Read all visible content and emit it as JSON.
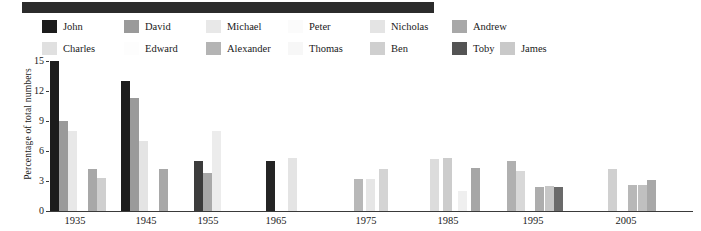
{
  "banner": {
    "label": ""
  },
  "legend": {
    "items": [
      {
        "label": "John",
        "color": "#1c1c1c",
        "x": 42,
        "y": 2
      },
      {
        "label": "David",
        "color": "#9a9a9a",
        "x": 124,
        "y": 2
      },
      {
        "label": "Michael",
        "color": "#e8e8e8",
        "x": 206,
        "y": 2
      },
      {
        "label": "Peter",
        "color": "#fbfbfb",
        "x": 288,
        "y": 2
      },
      {
        "label": "Nicholas",
        "color": "#e4e4e4",
        "x": 370,
        "y": 2
      },
      {
        "label": "Andrew",
        "color": "#a8a8a8",
        "x": 452,
        "y": 2
      },
      {
        "label": "James",
        "color": "#c9c9c9",
        "x": 500,
        "y": 24
      },
      {
        "label": "Charles",
        "color": "#e0e0e0",
        "x": 42,
        "y": 24
      },
      {
        "label": "Edward",
        "color": "#fdfdfd",
        "x": 124,
        "y": 24
      },
      {
        "label": "Alexander",
        "color": "#b4b4b4",
        "x": 206,
        "y": 24
      },
      {
        "label": "Thomas",
        "color": "#f7f7f7",
        "x": 288,
        "y": 24
      },
      {
        "label": "Ben",
        "color": "#cfcfcf",
        "x": 370,
        "y": 24
      },
      {
        "label": "Toby",
        "color": "#545454",
        "x": 452,
        "y": 24
      }
    ]
  },
  "chart_data": {
    "type": "bar",
    "title": "",
    "xlabel": "",
    "ylabel": "Percentage of total numbers",
    "ylim": [
      0,
      15
    ],
    "yticks": [
      0,
      3,
      6,
      9,
      12,
      15
    ],
    "grid": false,
    "legend_position": "top",
    "categories": [
      "1935",
      "1945",
      "1955",
      "1965",
      "1975",
      "1985",
      "1995",
      "2005"
    ],
    "series": [
      {
        "name": "John",
        "color": "#1c1c1c",
        "values": [
          15.0,
          13.0,
          5.0,
          5.0,
          0,
          0,
          0,
          0
        ]
      },
      {
        "name": "David",
        "color": "#9a9a9a",
        "values": [
          9.0,
          11.3,
          3.8,
          0,
          0,
          0,
          0,
          0
        ]
      },
      {
        "name": "Michael",
        "color": "#e8e8e8",
        "values": [
          8.0,
          7.0,
          8.0,
          0,
          0,
          0,
          0,
          0
        ]
      },
      {
        "name": "Peter",
        "color": "#fbfbfb",
        "values": [
          0,
          0,
          0,
          0,
          0,
          0,
          0,
          0
        ]
      },
      {
        "name": "Nicholas",
        "color": "#e4e4e4",
        "values": [
          0,
          0,
          0,
          5.3,
          0,
          0,
          0,
          0
        ]
      },
      {
        "name": "Andrew",
        "color": "#a8a8a8",
        "values": [
          4.2,
          4.2,
          0,
          0,
          3.2,
          0,
          0,
          0
        ]
      },
      {
        "name": "Charles",
        "color": "#e0e0e0",
        "values": [
          3.3,
          0,
          0,
          0,
          3.2,
          5.2,
          0,
          0
        ]
      },
      {
        "name": "Edward",
        "color": "#fdfdfd",
        "values": [
          0,
          0,
          0,
          0,
          4.2,
          5.3,
          0,
          0
        ]
      },
      {
        "name": "Alexander",
        "color": "#b4b4b4",
        "values": [
          0,
          0,
          0,
          0,
          0,
          2.0,
          5.0,
          0
        ]
      },
      {
        "name": "Thomas",
        "color": "#f7f7f7",
        "values": [
          0,
          0,
          0,
          0,
          0,
          4.3,
          4.0,
          4.2
        ]
      },
      {
        "name": "Ben",
        "color": "#cfcfcf",
        "values": [
          0,
          0,
          0,
          0,
          0,
          0,
          2.4,
          2.6
        ]
      },
      {
        "name": "Toby",
        "color": "#545454",
        "values": [
          0,
          0,
          0,
          0,
          0,
          0,
          2.4,
          0
        ]
      },
      {
        "name": "James",
        "color": "#c9c9c9",
        "values": [
          0,
          0,
          0,
          0,
          0,
          0,
          2.5,
          2.6
        ]
      }
    ],
    "bars": [
      {
        "group": "1935",
        "series": "John",
        "value": 15.0,
        "color": "#1c1c1c",
        "x": 2,
        "w": 9
      },
      {
        "group": "1935",
        "series": "David",
        "value": 9.0,
        "color": "#9a9a9a",
        "x": 11,
        "w": 9
      },
      {
        "group": "1935",
        "series": "Michael",
        "value": 8.0,
        "color": "#e8e8e8",
        "x": 20,
        "w": 9
      },
      {
        "group": "1935",
        "series": "Andrew",
        "value": 4.2,
        "color": "#a8a8a8",
        "x": 40,
        "w": 9
      },
      {
        "group": "1935",
        "series": "Charles",
        "value": 3.3,
        "color": "#cfcfcf",
        "x": 49,
        "w": 9
      },
      {
        "group": "1945",
        "series": "John",
        "value": 13.0,
        "color": "#1c1c1c",
        "x": 73,
        "w": 9
      },
      {
        "group": "1945",
        "series": "David",
        "value": 11.3,
        "color": "#9a9a9a",
        "x": 82,
        "w": 9
      },
      {
        "group": "1945",
        "series": "Michael",
        "value": 7.0,
        "color": "#e4e4e4",
        "x": 91,
        "w": 9
      },
      {
        "group": "1945",
        "series": "Andrew",
        "value": 4.2,
        "color": "#a8a8a8",
        "x": 111,
        "w": 9
      },
      {
        "group": "1955",
        "series": "John",
        "value": 5.0,
        "color": "#3c3c3c",
        "x": 146,
        "w": 9
      },
      {
        "group": "1955",
        "series": "David",
        "value": 3.8,
        "color": "#a8a8a8",
        "x": 155,
        "w": 9
      },
      {
        "group": "1955",
        "series": "Michael",
        "value": 8.0,
        "color": "#ececec",
        "x": 164,
        "w": 9
      },
      {
        "group": "1965",
        "series": "John",
        "value": 5.0,
        "color": "#242424",
        "x": 218,
        "w": 9
      },
      {
        "group": "1965",
        "series": "Nicholas",
        "value": 5.3,
        "color": "#e4e4e4",
        "x": 240,
        "w": 9
      },
      {
        "group": "1975",
        "series": "Andrew",
        "value": 3.2,
        "color": "#b8b8b8",
        "x": 306,
        "w": 9
      },
      {
        "group": "1975",
        "series": "Charles",
        "value": 3.2,
        "color": "#e6e6e6",
        "x": 318,
        "w": 9
      },
      {
        "group": "1975",
        "series": "Edward",
        "value": 4.2,
        "color": "#d4d4d4",
        "x": 331,
        "w": 9
      },
      {
        "group": "1985",
        "series": "Charles",
        "value": 5.2,
        "color": "#dcdcdc",
        "x": 382,
        "w": 9
      },
      {
        "group": "1985",
        "series": "Edward",
        "value": 5.3,
        "color": "#cccccc",
        "x": 395,
        "w": 9
      },
      {
        "group": "1985",
        "series": "Alexander",
        "value": 2.0,
        "color": "#efefef",
        "x": 410,
        "w": 9
      },
      {
        "group": "1985",
        "series": "Thomas",
        "value": 4.3,
        "color": "#a6a6a6",
        "x": 423,
        "w": 9
      },
      {
        "group": "1995",
        "series": "Alexander",
        "value": 5.0,
        "color": "#b0b0b0",
        "x": 459,
        "w": 9
      },
      {
        "group": "1995",
        "series": "Thomas",
        "value": 4.0,
        "color": "#d8d8d8",
        "x": 468,
        "w": 9
      },
      {
        "group": "1995",
        "series": "Ben",
        "value": 2.4,
        "color": "#adadad",
        "x": 487,
        "w": 9
      },
      {
        "group": "1995",
        "series": "James",
        "value": 2.5,
        "color": "#c6c6c6",
        "x": 497,
        "w": 9
      },
      {
        "group": "1995",
        "series": "Toby",
        "value": 2.4,
        "color": "#6a6a6a",
        "x": 506,
        "w": 9
      },
      {
        "group": "2005",
        "series": "Thomas",
        "value": 4.2,
        "color": "#d0d0d0",
        "x": 560,
        "w": 9
      },
      {
        "group": "2005",
        "series": "Ben",
        "value": 2.6,
        "color": "#b8b8b8",
        "x": 580,
        "w": 9
      },
      {
        "group": "2005",
        "series": "James",
        "value": 2.6,
        "color": "#c0c0c0",
        "x": 590,
        "w": 9
      },
      {
        "group": "2005",
        "series": "Andrew",
        "value": 3.1,
        "color": "#a8a8a8",
        "x": 599,
        "w": 9
      }
    ],
    "group_tick_x": [
      27,
      98,
      160,
      228,
      318,
      400,
      485,
      578
    ]
  }
}
